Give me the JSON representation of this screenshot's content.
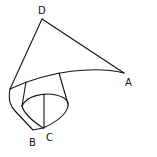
{
  "figure": {
    "labels": {
      "A": "A",
      "B": "B",
      "C": "C",
      "D": "D"
    },
    "colors": {
      "stroke": "#111111",
      "background": "#ffffff"
    }
  }
}
